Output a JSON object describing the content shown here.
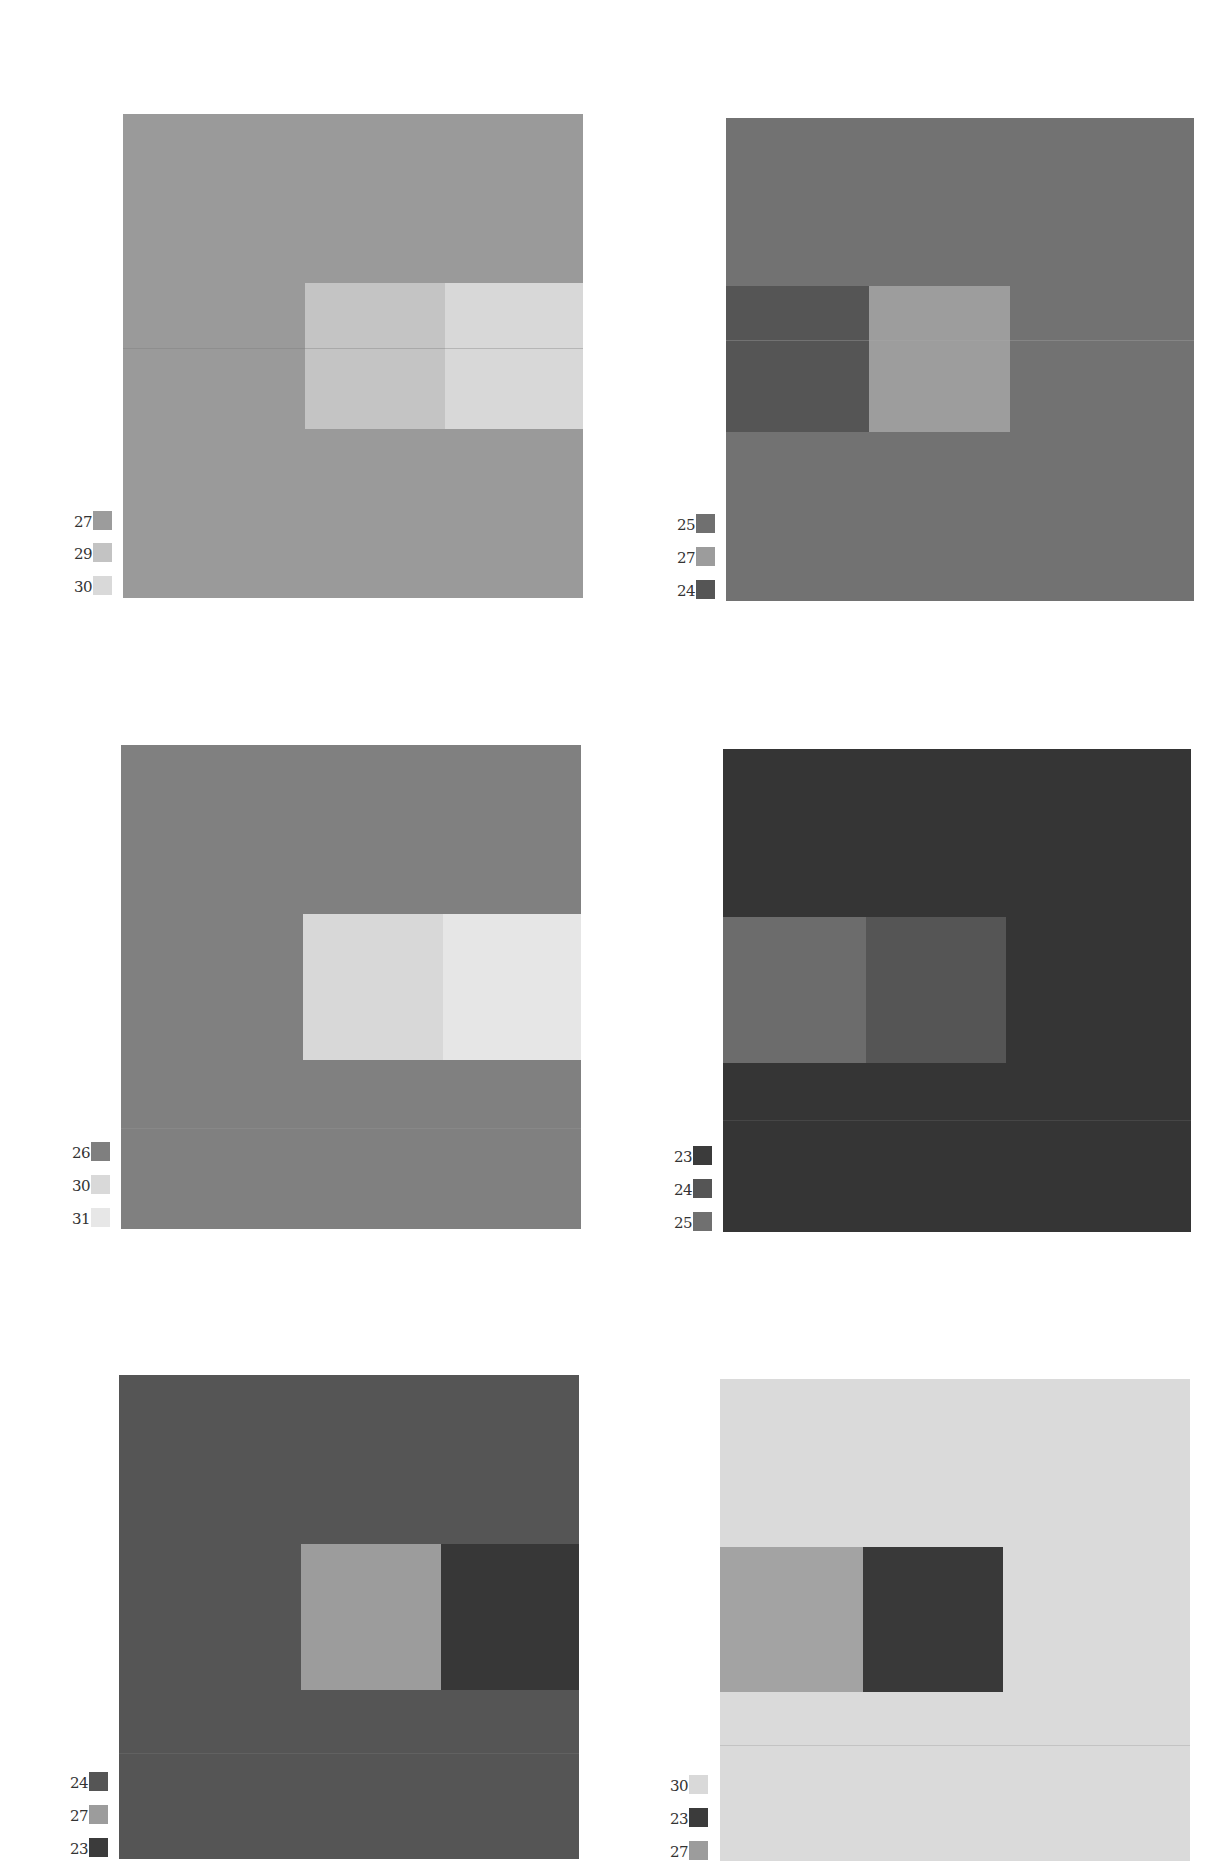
{
  "palette": {
    "23": "#3b3b3b",
    "24": "#555555",
    "25": "#707070",
    "26": "#7f7f7f",
    "27": "#9c9c9c",
    "29": "#c3c3c3",
    "30": "#d9d9d9",
    "31": "#e7e7e7"
  },
  "plates": [
    {
      "id": "plate-1",
      "legend": [
        "27",
        "29",
        "30"
      ],
      "field_color": "#9a9a9a",
      "left_block_color": "#c4c4c4",
      "right_block_color": "#d8d8d8"
    },
    {
      "id": "plate-2",
      "legend": [
        "25",
        "27",
        "24"
      ],
      "field_color": "#727272",
      "left_block_color": "#555555",
      "right_block_color": "#9d9d9d"
    },
    {
      "id": "plate-3",
      "legend": [
        "26",
        "30",
        "31"
      ],
      "field_color": "#808080",
      "left_block_color": "#d8d8d8",
      "right_block_color": "#e6e6e6"
    },
    {
      "id": "plate-4",
      "legend": [
        "23",
        "24",
        "25"
      ],
      "field_color": "#353535",
      "left_block_color": "#6c6c6c",
      "right_block_color": "#555555"
    },
    {
      "id": "plate-5",
      "legend": [
        "24",
        "27",
        "23"
      ],
      "field_color": "#555555",
      "left_block_color": "#9c9c9c",
      "right_block_color": "#373737"
    },
    {
      "id": "plate-6",
      "legend": [
        "30",
        "23",
        "27"
      ],
      "field_color": "#dadada",
      "left_block_color": "#a3a3a3",
      "right_block_color": "#393939"
    }
  ]
}
